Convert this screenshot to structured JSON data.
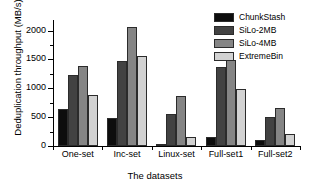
{
  "chart_data": {
    "type": "bar",
    "title": "",
    "xlabel": "The datasets",
    "ylabel": "Deduplication throughput (MB/s)",
    "categories": [
      "One-set",
      "Inc-set",
      "Linux-set",
      "Full-set1",
      "Full-set2"
    ],
    "series": [
      {
        "name": "ChunkStash",
        "color": "#0d0d0d",
        "values": [
          650,
          485,
          20,
          155,
          100
        ]
      },
      {
        "name": "SiLo-2MB",
        "color": "#424242",
        "values": [
          1225,
          1480,
          560,
          1365,
          510
        ]
      },
      {
        "name": "SiLo-4MB",
        "color": "#858585",
        "values": [
          1380,
          2060,
          865,
          1490,
          660
        ]
      },
      {
        "name": "ExtremeBin",
        "color": "#d2d2d2",
        "values": [
          880,
          1555,
          150,
          985,
          205
        ]
      }
    ],
    "ylim": [
      0,
      2150
    ],
    "yticks": [
      0,
      500,
      1000,
      1500,
      2000
    ],
    "ytick_labels": [
      "0",
      "500",
      "1000",
      "1500",
      "2000"
    ],
    "yminor_step": 250,
    "grid": false,
    "legend_position": "top-right",
    "legend_entries": [
      "ChunkStash",
      "SiLo-2MB",
      "SiLo-4MB",
      "ExtremeBin"
    ]
  }
}
